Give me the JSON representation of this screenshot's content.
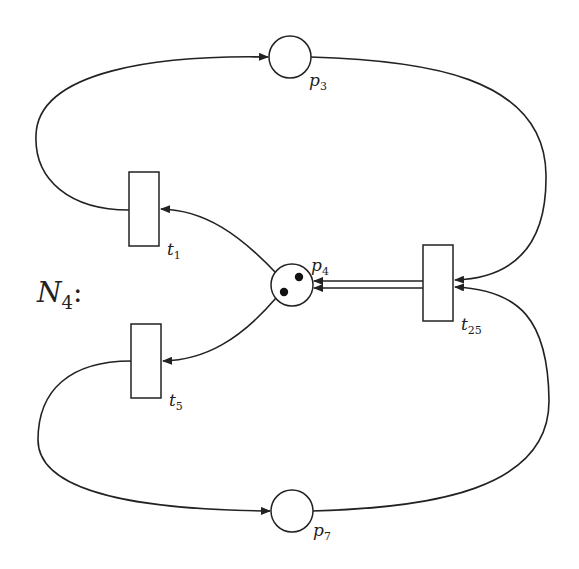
{
  "net": {
    "name_main": "N",
    "name_sub": "4",
    "name_suffix": ":"
  },
  "places": [
    {
      "id": "p3",
      "label_main": "p",
      "label_sub": "3",
      "tokens": 0
    },
    {
      "id": "p4",
      "label_main": "p",
      "label_sub": "4",
      "tokens": 2
    },
    {
      "id": "p7",
      "label_main": "p",
      "label_sub": "7",
      "tokens": 0
    }
  ],
  "transitions": [
    {
      "id": "t1",
      "label_main": "t",
      "label_sub": "1"
    },
    {
      "id": "t5",
      "label_main": "t",
      "label_sub": "5"
    },
    {
      "id": "t25",
      "label_main": "t",
      "label_sub": "25"
    }
  ],
  "arcs": [
    {
      "from": "p3",
      "to": "t25"
    },
    {
      "from": "t1",
      "to": "p3"
    },
    {
      "from": "p4",
      "to": "t1"
    },
    {
      "from": "p4",
      "to": "t5"
    },
    {
      "from": "t25",
      "to": "p4",
      "weight": 2
    },
    {
      "from": "t5",
      "to": "p7"
    },
    {
      "from": "p7",
      "to": "t25"
    }
  ],
  "colors": {
    "stroke": "#222222",
    "background": "#ffffff",
    "token": "#111111"
  }
}
